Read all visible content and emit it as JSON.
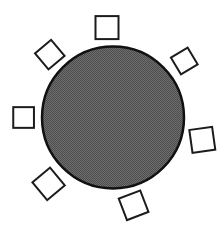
{
  "diagram": {
    "background_color": "#ffffff",
    "disc": {
      "name": "central-disc",
      "cx": 113,
      "cy": 117.5,
      "r": 71,
      "stroke": "#111111",
      "stroke_width": 2.5,
      "fill_light": "#6e6e6e",
      "fill_dark": "#4d4d4d"
    },
    "squares": {
      "fill": "#ffffff",
      "stroke": "#1c1c1c",
      "stroke_width": 2,
      "items": [
        {
          "name": "node-square-top",
          "cx": 107,
          "cy": 27.6,
          "size": 23,
          "rotation": 0
        },
        {
          "name": "node-square-upper-left",
          "cx": 49.8,
          "cy": 54.6,
          "size": 21,
          "rotation": 50
        },
        {
          "name": "node-square-upper-right",
          "cx": 184.3,
          "cy": 61,
          "size": 19.5,
          "rotation": 59
        },
        {
          "name": "node-square-left",
          "cx": 23.6,
          "cy": 117.5,
          "size": 20.7,
          "rotation": 0
        },
        {
          "name": "node-square-right",
          "cx": 202.3,
          "cy": 139.8,
          "size": 23,
          "rotation": -8
        },
        {
          "name": "node-square-lower-left",
          "cx": 48.6,
          "cy": 183.9,
          "size": 23,
          "rotation": 50
        },
        {
          "name": "node-square-bottom",
          "cx": 133.6,
          "cy": 205.3,
          "size": 23,
          "rotation": -21
        }
      ]
    }
  }
}
